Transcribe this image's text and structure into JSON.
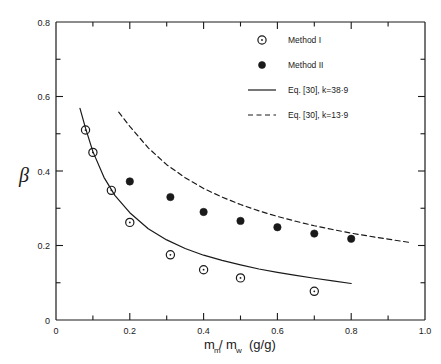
{
  "chart_data": {
    "type": "scatter",
    "title": "",
    "subtitle": "",
    "xlabel": "m_m/m_w  (g/g)",
    "xlabel_parts": {
      "m_main": "m",
      "m_sub": "m",
      "slash": "/",
      "w_main": "m",
      "w_sub": "w",
      "units": "(g/g)"
    },
    "ylabel": "β",
    "xlim": [
      0,
      1.0
    ],
    "ylim": [
      0,
      0.8
    ],
    "x_ticks_major": [
      "0",
      "0.2",
      "0.4",
      "0.6",
      "0.8",
      "1.0"
    ],
    "x_tick_values_major": [
      0,
      0.2,
      0.4,
      0.6,
      0.8,
      1.0
    ],
    "x_tick_values_minor": [
      0.1,
      0.3,
      0.5,
      0.7,
      0.9
    ],
    "y_ticks_major": [
      "0",
      "0.2",
      "0.4",
      "0.6",
      "0.8"
    ],
    "y_tick_values_major": [
      0,
      0.2,
      0.4,
      0.6,
      0.8
    ],
    "y_tick_values_minor": [
      0.1,
      0.3,
      0.5,
      0.7
    ],
    "grid": false,
    "legend_position": "top-right",
    "series": [
      {
        "name": "Method I",
        "marker": "open-circle",
        "type": "scatter",
        "x": [
          0.08,
          0.1,
          0.15,
          0.2,
          0.31,
          0.4,
          0.5,
          0.7
        ],
        "y": [
          0.51,
          0.45,
          0.348,
          0.262,
          0.175,
          0.135,
          0.113,
          0.077
        ]
      },
      {
        "name": "Method II",
        "marker": "filled-circle",
        "type": "scatter",
        "x": [
          0.2,
          0.31,
          0.4,
          0.5,
          0.6,
          0.7,
          0.8
        ],
        "y": [
          0.372,
          0.33,
          0.29,
          0.266,
          0.249,
          0.232,
          0.218
        ]
      },
      {
        "name": "Eq. [30], k=38·9",
        "marker": "solid-line",
        "type": "line",
        "k": 38.9,
        "x": [
          0.065,
          0.08,
          0.1,
          0.13,
          0.16,
          0.2,
          0.25,
          0.3,
          0.35,
          0.4,
          0.45,
          0.5,
          0.55,
          0.6,
          0.65,
          0.7,
          0.75,
          0.8
        ],
        "y": [
          0.568,
          0.515,
          0.452,
          0.383,
          0.334,
          0.288,
          0.245,
          0.215,
          0.192,
          0.174,
          0.16,
          0.148,
          0.137,
          0.128,
          0.12,
          0.112,
          0.105,
          0.098
        ]
      },
      {
        "name": "Eq. [30], k=13·9",
        "marker": "dashed-line",
        "type": "line",
        "k": 13.9,
        "x": [
          0.17,
          0.2,
          0.25,
          0.3,
          0.35,
          0.4,
          0.45,
          0.5,
          0.55,
          0.6,
          0.65,
          0.7,
          0.75,
          0.8,
          0.85,
          0.9,
          0.96
        ],
        "y": [
          0.558,
          0.52,
          0.462,
          0.417,
          0.382,
          0.353,
          0.33,
          0.31,
          0.293,
          0.278,
          0.265,
          0.253,
          0.243,
          0.233,
          0.225,
          0.217,
          0.208
        ]
      }
    ]
  },
  "legend": {
    "items": [
      {
        "label": "Method I",
        "glyph": "open-circle"
      },
      {
        "label": "Method II",
        "glyph": "filled-circle"
      },
      {
        "label": "Eq. [30], k=38·9",
        "glyph": "solid-line"
      },
      {
        "label": "Eq. [30], k=13·9",
        "glyph": "dashed-line"
      }
    ]
  },
  "colors": {
    "ink": "#1a1a1a",
    "background": "#ffffff"
  }
}
